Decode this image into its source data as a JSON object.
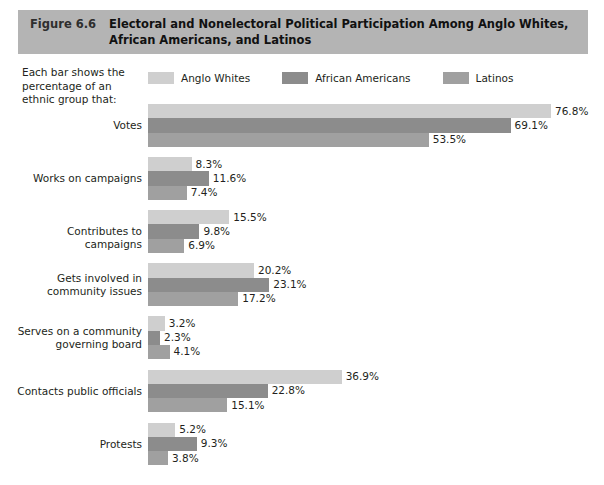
{
  "header": {
    "figure_number": "Figure 6.6",
    "title": "Electoral and Nonelectoral Political Participation Among Anglo Whites, African Americans, and Latinos",
    "band_color": "#b4b4b4"
  },
  "caption": "Each bar shows the percentage of an ethnic group that:",
  "legend": {
    "items": [
      {
        "label": "Anglo Whites",
        "color": "#cfcfcf"
      },
      {
        "label": "African Americans",
        "color": "#8c8c8c"
      },
      {
        "label": "Latinos",
        "color": "#a0a0a0"
      }
    ]
  },
  "chart_data": {
    "type": "bar",
    "orientation": "horizontal",
    "title": "Electoral and Nonelectoral Political Participation Among Anglo Whites, African Americans, and Latinos",
    "xlabel": "",
    "ylabel": "",
    "xlim": [
      0,
      76.8
    ],
    "grid": false,
    "legend_position": "top",
    "value_suffix": "%",
    "categories": [
      "Votes",
      "Works on campaigns",
      "Contributes to campaigns",
      "Gets involved in community issues",
      "Serves on a community governing board",
      "Contacts public officials",
      "Protests"
    ],
    "category_lines": [
      [
        "Votes"
      ],
      [
        "Works on campaigns"
      ],
      [
        "Contributes to campaigns"
      ],
      [
        "Gets involved in",
        "community issues"
      ],
      [
        "Serves on a community",
        "governing board"
      ],
      [
        "Contacts public officials"
      ],
      [
        "Protests"
      ]
    ],
    "series": [
      {
        "name": "Anglo Whites",
        "color": "#cfcfcf",
        "values": [
          76.8,
          8.3,
          15.5,
          20.2,
          3.2,
          36.9,
          5.2
        ],
        "labels": [
          "76.8%",
          "8.3%",
          "15.5%",
          "20.2%",
          "3.2%",
          "36.9%",
          "5.2%"
        ]
      },
      {
        "name": "African Americans",
        "color": "#8c8c8c",
        "values": [
          69.1,
          11.6,
          9.8,
          23.1,
          2.3,
          22.8,
          9.3
        ],
        "labels": [
          "69.1%",
          "11.6%",
          "9.8%",
          "23.1%",
          "2.3%",
          "22.8%",
          "9.3%"
        ]
      },
      {
        "name": "Latinos",
        "color": "#a0a0a0",
        "values": [
          53.5,
          7.4,
          6.9,
          17.2,
          4.1,
          15.1,
          3.8
        ],
        "labels": [
          "53.5%",
          "7.4%",
          "6.9%",
          "17.2%",
          "4.1%",
          "15.1%",
          "3.8%"
        ]
      }
    ]
  }
}
